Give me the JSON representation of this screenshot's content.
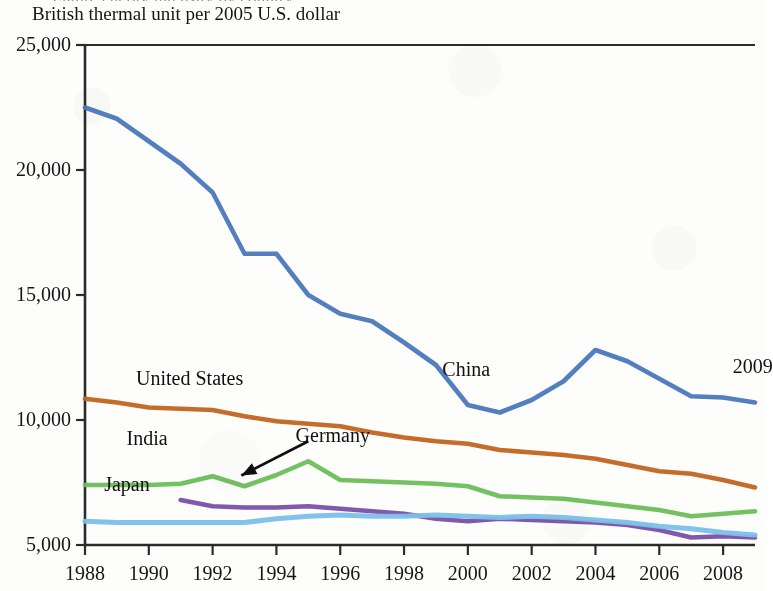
{
  "figure": {
    "clipped_title_fragment": "Figure  energy intensity by country",
    "subtitle": "British thermal unit per 2005 U.S. dollar",
    "end_year_annotation": "2009"
  },
  "chart_data": {
    "type": "line",
    "title": "",
    "subtitle": "British thermal unit per 2005 U.S. dollar",
    "xlabel": "",
    "ylabel": "British thermal unit per 2005 U.S. dollar",
    "xlim": [
      1988,
      2009
    ],
    "ylim": [
      5000,
      25000
    ],
    "grid": false,
    "legend_position": "inline-annotations",
    "y_ticks": [
      5000,
      10000,
      15000,
      20000,
      25000
    ],
    "y_tick_labels": [
      "5,000",
      "10,000",
      "15,000",
      "20,000",
      "25,000"
    ],
    "x_ticks": [
      1988,
      1990,
      1992,
      1994,
      1996,
      1998,
      2000,
      2002,
      2004,
      2006,
      2008
    ],
    "x_tick_labels": [
      "1988",
      "1990",
      "1992",
      "1994",
      "1996",
      "1998",
      "2000",
      "2002",
      "2004",
      "2006",
      "2008"
    ],
    "annotations": [
      {
        "text": "China",
        "x": 1999.2,
        "y": 12050
      },
      {
        "text": "United States",
        "x": 1989.6,
        "y": 11700
      },
      {
        "text": "India",
        "x": 1989.3,
        "y": 9300
      },
      {
        "text": "Germany",
        "x": 1994.6,
        "y": 9400
      },
      {
        "text": "Japan",
        "x": 1988.6,
        "y": 7450
      },
      {
        "text": "2009",
        "x": 2008.3,
        "y": 12150
      }
    ],
    "arrow": {
      "label": "Germany",
      "from_x": 1995.0,
      "from_y": 9150,
      "to_x": 1992.9,
      "to_y": 7780
    },
    "series": [
      {
        "name": "China",
        "color": "#4a77bc",
        "x": [
          1988,
          1989,
          1990,
          1991,
          1992,
          1993,
          1994,
          1995,
          1996,
          1997,
          1998,
          1999,
          2000,
          2001,
          2002,
          2003,
          2004,
          2005,
          2006,
          2007,
          2008,
          2009
        ],
        "values": [
          22500,
          22050,
          21150,
          20250,
          19100,
          16650,
          16650,
          15000,
          14250,
          13950,
          13100,
          12200,
          10600,
          10300,
          10800,
          11550,
          12800,
          12350,
          11650,
          10950,
          10900,
          10700
        ]
      },
      {
        "name": "United States",
        "color": "#c1651f",
        "x": [
          1988,
          1989,
          1990,
          1991,
          1992,
          1993,
          1994,
          1995,
          1996,
          1997,
          1998,
          1999,
          2000,
          2001,
          2002,
          2003,
          2004,
          2005,
          2006,
          2007,
          2008,
          2009
        ],
        "values": [
          10850,
          10700,
          10500,
          10450,
          10400,
          10150,
          9950,
          9850,
          9750,
          9500,
          9300,
          9150,
          9050,
          8800,
          8700,
          8600,
          8450,
          8200,
          7950,
          7850,
          7600,
          7300
        ]
      },
      {
        "name": "India",
        "color": "#6cbe5a",
        "x": [
          1988,
          1989,
          1990,
          1991,
          1992,
          1993,
          1994,
          1995,
          1996,
          1997,
          1998,
          1999,
          2000,
          2001,
          2002,
          2003,
          2004,
          2005,
          2006,
          2007,
          2008,
          2009
        ],
        "values": [
          7400,
          7400,
          7400,
          7450,
          7750,
          7350,
          7800,
          8350,
          7600,
          7550,
          7500,
          7450,
          7350,
          6950,
          6900,
          6850,
          6700,
          6550,
          6400,
          6150,
          6250,
          6350
        ]
      },
      {
        "name": "Germany",
        "color": "#7b4fa8",
        "x": [
          1991,
          1992,
          1993,
          1994,
          1995,
          1996,
          1997,
          1998,
          1999,
          2000,
          2001,
          2002,
          2003,
          2004,
          2005,
          2006,
          2007,
          2008,
          2009
        ],
        "values": [
          6800,
          6550,
          6500,
          6500,
          6550,
          6450,
          6350,
          6250,
          6050,
          5950,
          6050,
          6000,
          5950,
          5900,
          5800,
          5600,
          5300,
          5350,
          5300
        ]
      },
      {
        "name": "Japan",
        "color": "#7cc0ea",
        "x": [
          1988,
          1989,
          1990,
          1991,
          1992,
          1993,
          1994,
          1995,
          1996,
          1997,
          1998,
          1999,
          2000,
          2001,
          2002,
          2003,
          2004,
          2005,
          2006,
          2007,
          2008,
          2009
        ],
        "values": [
          5950,
          5900,
          5900,
          5900,
          5900,
          5900,
          6050,
          6150,
          6200,
          6150,
          6150,
          6200,
          6150,
          6100,
          6150,
          6100,
          6000,
          5900,
          5750,
          5650,
          5500,
          5400
        ]
      }
    ]
  }
}
